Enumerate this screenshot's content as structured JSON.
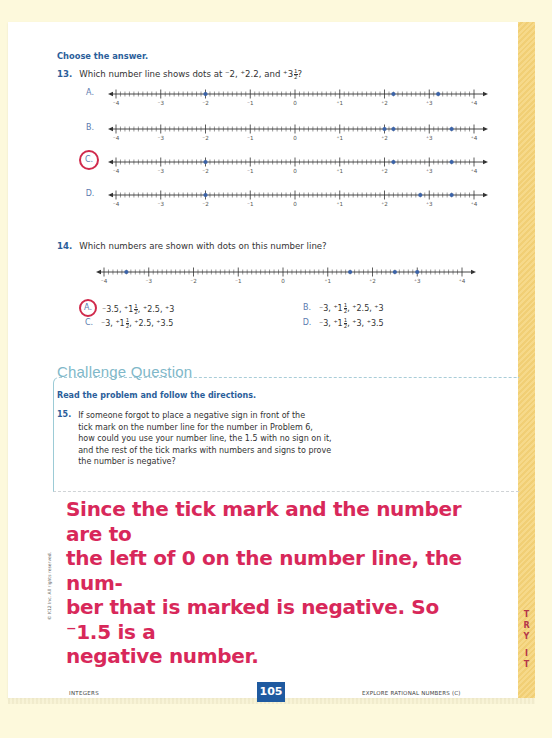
{
  "page": {
    "background_color": "#fdf9dc",
    "strip_color": "#f3d47e",
    "accent_blue": "#2b5e9a",
    "answer_red": "#d8285a"
  },
  "section1": {
    "instruction": "Choose the answer."
  },
  "q13": {
    "number": "13.",
    "text_prefix": "Which number line shows dots at ",
    "text_values": "⁻2, ⁺2.2, and ⁺3",
    "frac_num": "1",
    "frac_den": "2",
    "text_suffix": "?",
    "tick_labels": [
      "⁻4",
      "⁻3",
      "⁻2",
      "⁻1",
      "0",
      "⁺1",
      "⁺2",
      "⁺3",
      "⁺4"
    ],
    "options": [
      {
        "letter": "A.",
        "dots": [
          -2,
          2.2,
          3.2
        ],
        "circled": false
      },
      {
        "letter": "B.",
        "dots": [
          2,
          2.2,
          3.5
        ],
        "circled": false
      },
      {
        "letter": "C.",
        "dots": [
          -2,
          2.2,
          3.5
        ],
        "circled": true
      },
      {
        "letter": "D.",
        "dots": [
          -2,
          2.8,
          3.5
        ],
        "circled": false
      }
    ]
  },
  "q14": {
    "number": "14.",
    "text": "Which numbers are shown with dots on this number line?",
    "tick_labels": [
      "⁻4",
      "⁻3",
      "⁻2",
      "⁻1",
      "0",
      "⁺1",
      "⁺2",
      "⁺3",
      "⁺4"
    ],
    "dots": [
      -3.5,
      1.5,
      2.5,
      3
    ],
    "answers": [
      {
        "letter": "A.",
        "pre": "⁻3.5, ⁺1",
        "num": "1",
        "den": "2",
        "post": ", ⁺2.5, ⁺3",
        "circled": true
      },
      {
        "letter": "B.",
        "pre": "⁻3, ⁺1",
        "num": "1",
        "den": "2",
        "post": ", ⁺2.5, ⁺3",
        "circled": false
      },
      {
        "letter": "C.",
        "pre": "⁻3, ⁺1",
        "num": "1",
        "den": "2",
        "post": ", ⁺2.5, ⁺3.5",
        "circled": false
      },
      {
        "letter": "D.",
        "pre": "⁻3, ⁺1",
        "num": "1",
        "den": "2",
        "post": ", ⁺3, ⁺3.5",
        "circled": false
      }
    ]
  },
  "challenge": {
    "title": "Challenge Question",
    "instruction": "Read the problem and follow the directions.",
    "q15_number": "15.",
    "q15_lines": [
      "If someone forgot to place a negative sign in front of the",
      "tick mark on the number line for the number in Problem 6,",
      "how could you use your number line, the 1.5 with no sign on it,",
      "and the rest of the tick marks with numbers and signs to prove",
      "the number is negative?"
    ]
  },
  "handwritten_answer": {
    "lines": [
      "Since the tick mark and the number are to",
      "the left of 0 on the number line, the num-",
      "ber that is marked is negative. So ⁻1.5 is a",
      "negative number."
    ]
  },
  "margin": {
    "copyright": "© K12 Inc. All rights reserved.",
    "side_tab": [
      "T",
      "R",
      "Y",
      "",
      "I",
      "T"
    ]
  },
  "footer": {
    "left": "INTEGERS",
    "page_number": "105",
    "right": "EXPLORE RATIONAL NUMBERS (C)"
  }
}
